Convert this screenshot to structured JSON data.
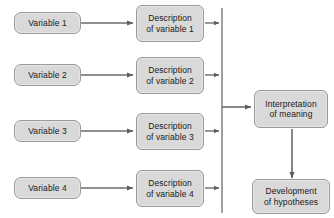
{
  "diagram": {
    "background_color": "#ffffff",
    "node_fill_color": "#d9d9d9",
    "node_border_color": "#9a9a9a",
    "connector_color": "#6b6b6b",
    "bus_color": "#8a8a8a",
    "variables": [
      {
        "id": "variable-1",
        "label": "Variable 1"
      },
      {
        "id": "variable-2",
        "label": "Variable 2"
      },
      {
        "id": "variable-3",
        "label": "Variable 3"
      },
      {
        "id": "variable-4",
        "label": "Variable 4"
      }
    ],
    "descriptions": [
      {
        "id": "description-1",
        "label": "Description\nof variable 1"
      },
      {
        "id": "description-2",
        "label": "Description\nof variable 2"
      },
      {
        "id": "description-3",
        "label": "Description\nof variable 3"
      },
      {
        "id": "description-4",
        "label": "Description\nof variable 4"
      }
    ],
    "outcomes": [
      {
        "id": "interpretation",
        "label": "Interpretation\nof meaning"
      },
      {
        "id": "hypotheses",
        "label": "Development\nof hypotheses"
      }
    ]
  }
}
